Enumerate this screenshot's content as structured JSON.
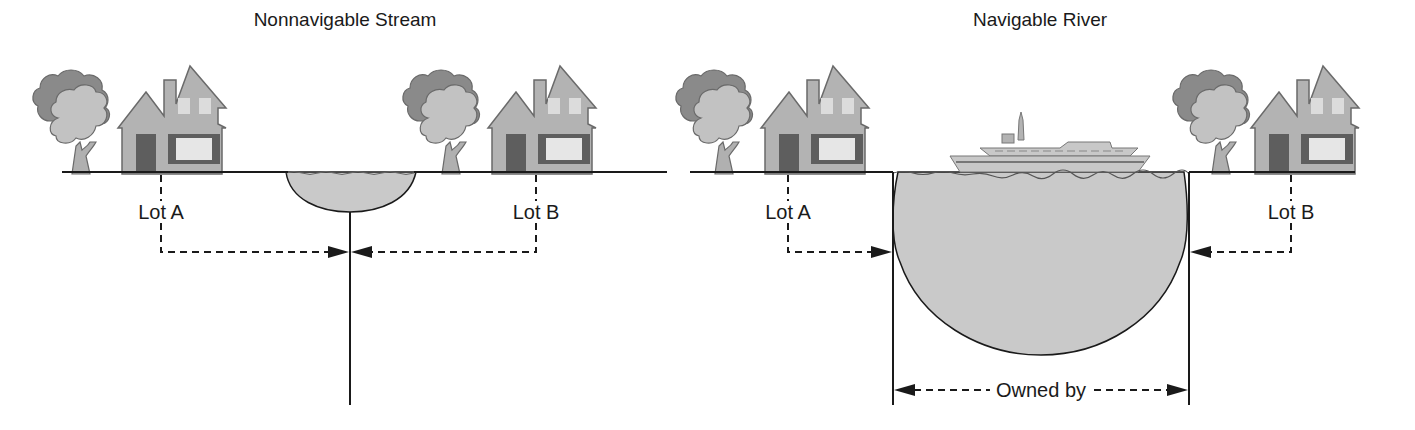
{
  "diagrams": [
    {
      "title": "Nonnavigable Stream",
      "lots": [
        {
          "label": "Lot A"
        },
        {
          "label": "Lot B"
        }
      ]
    },
    {
      "title": "Navigable River",
      "lots": [
        {
          "label": "Lot A"
        },
        {
          "label": "Lot B"
        }
      ],
      "ownership_label": "Owned by"
    }
  ],
  "colors": {
    "ink": "#1a1a1a",
    "water": "#c9c9c9",
    "house_wall": "#b3b3b3",
    "house_door": "#5e5e5e",
    "house_window": "#e6e6e6",
    "tree_dark": "#8a8a8a",
    "tree_light": "#c2c2c2"
  }
}
